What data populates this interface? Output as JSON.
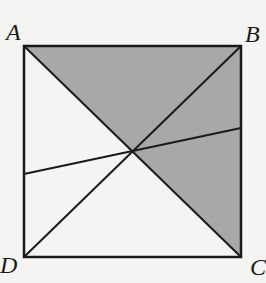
{
  "diagram": {
    "type": "geometry",
    "vertices": {
      "A": {
        "label": "A",
        "x": 24,
        "y": 46
      },
      "B": {
        "label": "B",
        "x": 241,
        "y": 46
      },
      "C": {
        "label": "C",
        "x": 241,
        "y": 257
      },
      "D": {
        "label": "D",
        "x": 24,
        "y": 257
      }
    },
    "center": {
      "x": 132,
      "y": 152
    },
    "transversal": {
      "start": {
        "x": 24,
        "y": 174
      },
      "end": {
        "x": 241,
        "y": 128
      }
    },
    "colors": {
      "background": "#f4f4f2",
      "shade": "#a8a8a8",
      "stroke": "#1a1a1a"
    }
  },
  "labels": {
    "A": "A",
    "B": "B",
    "C": "C",
    "D": "D"
  }
}
